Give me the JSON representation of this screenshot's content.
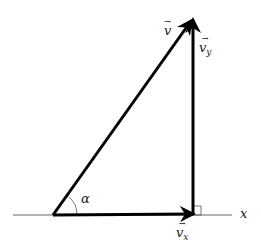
{
  "diagram": {
    "type": "vector-decomposition",
    "colors": {
      "stroke": "#000000",
      "axis": "#555555",
      "text": "#1a1a1a",
      "background": "#ffffff"
    },
    "labels": {
      "v": {
        "base": "v",
        "sub": "",
        "arrow": "→"
      },
      "vy": {
        "base": "v",
        "sub": "y",
        "arrow": "→"
      },
      "vx": {
        "base": "v",
        "sub": "x",
        "arrow": "→"
      },
      "alpha": "α",
      "x_axis": "x"
    }
  }
}
